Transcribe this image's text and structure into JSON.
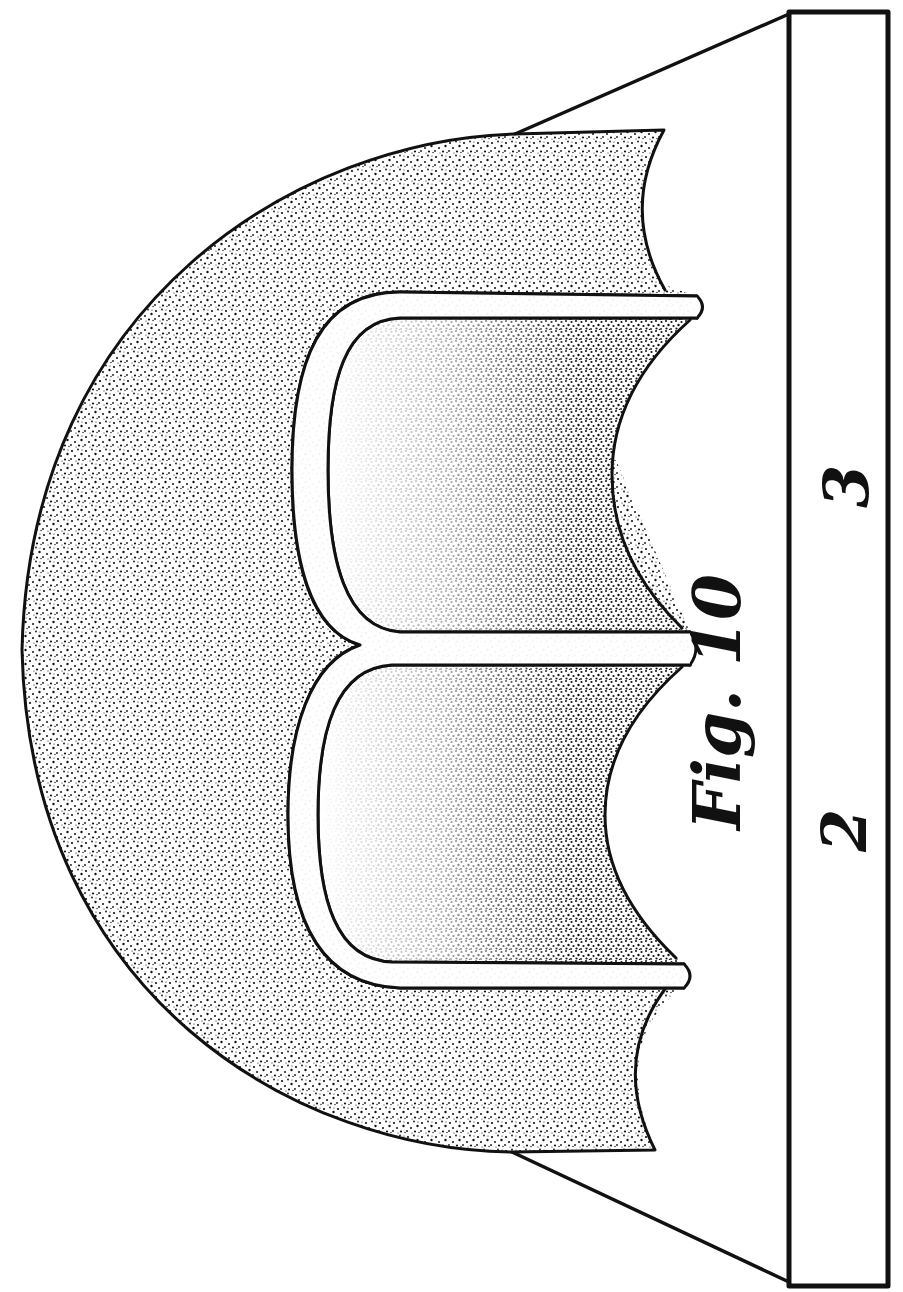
{
  "figure": {
    "title": "Fig. 10",
    "orientation": "rotated 90° counter-clockwise (text reads bottom-to-top)",
    "style": "engraved patent line drawing with stipple shading",
    "colors": {
      "ink": "#111111",
      "paper": "#ffffff"
    }
  },
  "labels": {
    "fig_caption": "Fig. 10",
    "part_2": "2",
    "part_3": "3"
  },
  "components": [
    {
      "name": "base-plate",
      "description": "Long rectangular base strip along the right edge"
    },
    {
      "name": "outer-shell",
      "description": "Stippled arched shell / dome body"
    },
    {
      "name": "inner-ribs",
      "description": "Two U-shaped hollow channels separated by a central rib"
    },
    {
      "name": "support-flanges",
      "description": "Diagonal lines connecting shell to base plate at each end"
    }
  ]
}
